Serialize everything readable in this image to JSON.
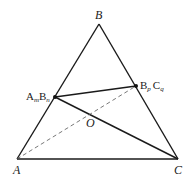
{
  "diagram": {
    "type": "geometry-triangle",
    "colors": {
      "stroke": "#1a1a1a",
      "dashed": "#555555",
      "text": "#222222",
      "background": "#ffffff"
    },
    "points": {
      "A": {
        "label": "A",
        "x": 17,
        "y": 159
      },
      "B": {
        "label": "B",
        "x": 99,
        "y": 24
      },
      "C": {
        "label": "C",
        "x": 178,
        "y": 159
      },
      "P": {
        "label_main1": "A",
        "label_sub1": "m",
        "label_main2": "B",
        "label_sub2": "n",
        "x": 55,
        "y": 97
      },
      "Q": {
        "label_main1": "B",
        "label_sub1": "p",
        "label_main2": "C",
        "label_sub2": "q",
        "x": 136,
        "y": 86
      },
      "O": {
        "label": "O",
        "x": 90,
        "y": 116
      }
    },
    "segments": [
      {
        "from": "A",
        "to": "B",
        "style": "solid"
      },
      {
        "from": "B",
        "to": "C",
        "style": "solid"
      },
      {
        "from": "A",
        "to": "C",
        "style": "solid"
      },
      {
        "from": "P",
        "to": "Q",
        "style": "solid"
      },
      {
        "from": "P",
        "to": "C",
        "style": "solid"
      },
      {
        "from": "A",
        "to": "Q",
        "style": "dashed"
      }
    ]
  }
}
